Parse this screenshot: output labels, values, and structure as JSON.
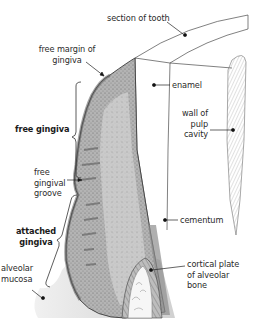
{
  "diagram": {
    "type": "anatomical-cross-section",
    "labels": {
      "section_of_tooth": "section of tooth",
      "free_margin_line1": "free margin of",
      "free_margin_line2": "gingiva",
      "enamel": "enamel",
      "wall_of_pulp_line1": "wall of",
      "wall_of_pulp_line2": "pulp",
      "wall_of_pulp_line3": "cavity",
      "free_gingiva": "free gingiva",
      "free_gingival_groove_line1": "free",
      "free_gingival_groove_line2": "gingival",
      "free_gingival_groove_line3": "groove",
      "cementum": "cementum",
      "attached_gingiva_line1": "attached",
      "attached_gingiva_line2": "gingiva",
      "alveolar_mucosa_line1": "alveolar",
      "alveolar_mucosa_line2": "mucosa",
      "cortical_plate_line1": "cortical plate",
      "cortical_plate_line2": "of alveolar",
      "cortical_plate_line3": "bone"
    },
    "colors": {
      "line": "#3a3a3a",
      "tissue_dark": "#6e6e6e",
      "tissue_mid": "#a9a9a9",
      "tissue_light": "#d6d6d6",
      "mucosa": "#e4e4e4",
      "background": "#ffffff"
    }
  }
}
